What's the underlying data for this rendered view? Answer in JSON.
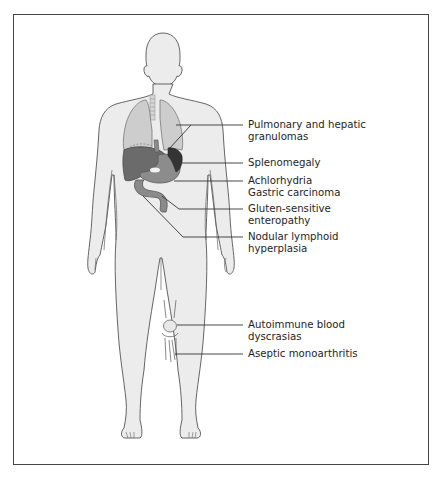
{
  "figure": {
    "type": "anatomical-diagram",
    "colors": {
      "frame": "#444444",
      "body_fill": "#ececec",
      "outline": "#555555",
      "lungs": "#cdcdcd",
      "liver": "#6b6b6b",
      "stomach": "#8c8c8c",
      "spleen": "#343434",
      "intestine": "#8a8a8a",
      "leader_line": "#333333",
      "text": "#1e1e1e"
    },
    "labels": [
      {
        "id": "pulmonary",
        "lines": [
          "Pulmonary and hepatic",
          "granulomas"
        ],
        "target": "lungs-liver"
      },
      {
        "id": "spleno",
        "lines": [
          "Splenomegaly"
        ],
        "target": "spleen"
      },
      {
        "id": "achlor",
        "lines": [
          "Achlorhydria",
          "Gastric carcinoma"
        ],
        "target": "stomach"
      },
      {
        "id": "gluten",
        "lines": [
          "Gluten-sensitive",
          "enteropathy"
        ],
        "target": "small-intestine"
      },
      {
        "id": "nodular",
        "lines": [
          "Nodular lymphoid",
          "hyperplasia"
        ],
        "target": "intestine"
      },
      {
        "id": "autoimmune",
        "lines": [
          "Autoimmune blood",
          "dyscrasias"
        ],
        "target": "knee"
      },
      {
        "id": "aseptic",
        "lines": [
          "Aseptic monoarthritis"
        ],
        "target": "knee-joint"
      }
    ]
  }
}
